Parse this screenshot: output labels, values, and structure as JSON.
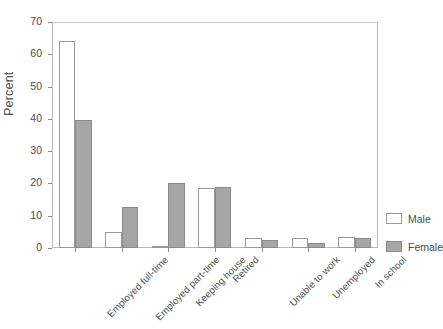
{
  "chart_data": {
    "type": "bar",
    "title": "",
    "xlabel": "",
    "ylabel": "Percent",
    "ylim": [
      0,
      70
    ],
    "yticks": [
      0,
      10,
      20,
      30,
      40,
      50,
      60,
      70
    ],
    "grid": false,
    "legend_position": "right",
    "categories": [
      "Employed full-time",
      "Employed part-time",
      "Keeping house",
      "Retired",
      "Unable to work",
      "Unemployed",
      "In school"
    ],
    "series": [
      {
        "name": "Male",
        "color": "#ffffff",
        "values": [
          64.0,
          5.0,
          0.4,
          18.7,
          3.0,
          3.0,
          3.5
        ]
      },
      {
        "name": "Female",
        "color": "#a6a6a6",
        "values": [
          39.5,
          12.7,
          20.1,
          18.8,
          2.5,
          1.5,
          3.0
        ]
      }
    ]
  },
  "legend": {
    "items": [
      {
        "label": "Male"
      },
      {
        "label": "Female"
      }
    ]
  },
  "axis": {
    "y_title": "Percent",
    "y_tick_labels": [
      "0",
      "10",
      "20",
      "30",
      "40",
      "50",
      "60",
      "70"
    ]
  },
  "colors": {
    "male_fill": "#ffffff",
    "female_fill": "#a6a6a6",
    "outline": "#9a9a9a",
    "text": "#4d4d4d",
    "frame": "#b9b9b9"
  }
}
